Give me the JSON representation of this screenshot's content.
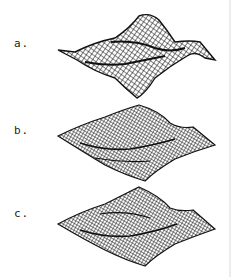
{
  "figure": {
    "panels": [
      {
        "label": "a.",
        "style": "sparse-mesh",
        "description": "wireframe surface with pronounced peaks"
      },
      {
        "label": "b.",
        "style": "dense-mesh",
        "description": "wireframe surface, flatter plateau"
      },
      {
        "label": "c.",
        "style": "dense-mesh",
        "description": "wireframe surface, rougher texture"
      }
    ],
    "colors": {
      "mesh": "#111111",
      "background": "#ffffff"
    }
  }
}
